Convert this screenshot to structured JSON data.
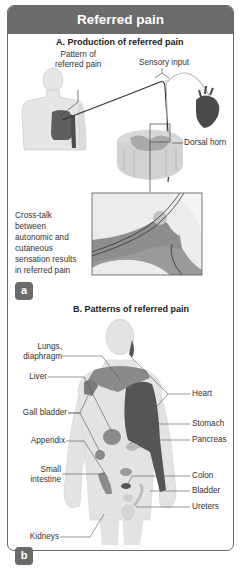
{
  "header": {
    "title": "Referred pain"
  },
  "panel_a": {
    "title": "A. Production of referred pain",
    "labels": {
      "pattern": "Pattern of\nreferred pain",
      "pattern_line1": "Pattern of",
      "pattern_line2": "referred pain",
      "sensory_input": "Sensory input",
      "dorsal_horn": "Dorsal horn",
      "crosstalk_lines": [
        "Cross-talk",
        "between",
        "autonomic and",
        "cutaneous",
        "sensation results",
        "in referred pain"
      ]
    },
    "badge": "a"
  },
  "panel_b": {
    "title": "B. Patterns of referred pain",
    "left_labels": [
      {
        "lines": [
          "Lungs,",
          "diaphragm"
        ]
      },
      {
        "lines": [
          "Liver"
        ]
      },
      {
        "lines": [
          "Gall bladder"
        ]
      },
      {
        "lines": [
          "Appendix"
        ]
      },
      {
        "lines": [
          "Small",
          "intestine"
        ]
      },
      {
        "lines": [
          "Kidneys"
        ]
      }
    ],
    "right_labels": [
      "Heart",
      "Stomach",
      "Pancreas",
      "Colon",
      "Bladder",
      "Ureters"
    ],
    "badge": "b"
  },
  "colors": {
    "header": "#6b6b6b",
    "pain_dark": "#5a5a5a",
    "pain_mid": "#8c8c8c",
    "skin": "#e4e4e4",
    "outline": "#bdbdbd"
  }
}
